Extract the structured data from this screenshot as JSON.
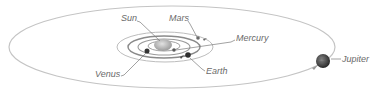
{
  "diagram": {
    "type": "solar-system-orbits",
    "colors": {
      "orbit": "#b9b9b9",
      "leader": "#7a7a7a",
      "label": "#6a6a6a",
      "sun": "#b5b5b5",
      "planet": "#3a3a3a"
    },
    "labels": {
      "sun": "Sun",
      "mars": "Mars",
      "mercury": "Mercury",
      "earth": "Earth",
      "venus": "Venus",
      "jupiter": "Jupiter"
    }
  }
}
